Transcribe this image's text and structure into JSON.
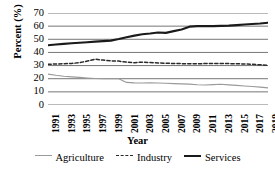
{
  "chart_data": {
    "type": "line",
    "title": "",
    "xlabel": "Year",
    "ylabel": "Percent (%)",
    "ylim": [
      0,
      70
    ],
    "ytick_values": [
      0,
      10,
      20,
      30,
      40,
      50,
      60,
      70
    ],
    "ytick_labels": [
      "0",
      "10",
      "20",
      "30",
      "40",
      "50",
      "60",
      "70"
    ],
    "grid": true,
    "legend_position": "bottom",
    "x": [
      1991,
      1992,
      1993,
      1994,
      1995,
      1996,
      1997,
      1998,
      1999,
      2000,
      2001,
      2002,
      2003,
      2004,
      2005,
      2006,
      2007,
      2008,
      2009,
      2010,
      2011,
      2012,
      2013,
      2014,
      2015,
      2016,
      2017,
      2018,
      2019
    ],
    "xtick_labels": [
      "1991",
      "1993",
      "1995",
      "1997",
      "1999",
      "2001",
      "2003",
      "2005",
      "2007",
      "2009",
      "2011",
      "2013",
      "2015",
      "2017",
      "2019"
    ],
    "xtick_values": [
      1991,
      1993,
      1995,
      1997,
      1999,
      2001,
      2003,
      2005,
      2007,
      2009,
      2011,
      2013,
      2015,
      2017,
      2019
    ],
    "series": [
      {
        "name": "Agriculture",
        "style": "solid",
        "color": "#9a9a9a",
        "width": 1.1,
        "values": [
          23.5,
          22.6,
          21.9,
          21.4,
          21.0,
          20.6,
          20.2,
          20.1,
          20.0,
          20.0,
          17.2,
          16.8,
          16.7,
          16.9,
          16.7,
          16.5,
          16.3,
          16.1,
          15.9,
          15.4,
          15.2,
          15.5,
          15.8,
          15.3,
          14.9,
          14.5,
          14.1,
          13.6,
          13.0
        ]
      },
      {
        "name": "Industry",
        "style": "dashed",
        "color": "#2a2a2a",
        "width": 1.5,
        "values": [
          31.0,
          31.2,
          31.4,
          31.6,
          32.2,
          33.4,
          34.8,
          34.2,
          33.6,
          33.4,
          32.6,
          32.2,
          32.6,
          32.3,
          32.0,
          31.8,
          31.6,
          31.5,
          31.3,
          31.4,
          31.5,
          31.5,
          31.6,
          31.5,
          31.4,
          31.2,
          31.0,
          30.6,
          30.2
        ]
      },
      {
        "name": "Services",
        "style": "solid",
        "color": "#1a1a1a",
        "width": 2.1,
        "values": [
          45.5,
          46.0,
          46.5,
          47.0,
          47.4,
          47.8,
          48.2,
          48.6,
          49.0,
          50.2,
          51.6,
          52.8,
          53.8,
          54.4,
          55.2,
          54.9,
          56.2,
          57.4,
          59.6,
          60.0,
          60.1,
          60.0,
          60.2,
          60.4,
          60.8,
          61.2,
          61.6,
          62.0,
          62.6
        ]
      }
    ]
  }
}
